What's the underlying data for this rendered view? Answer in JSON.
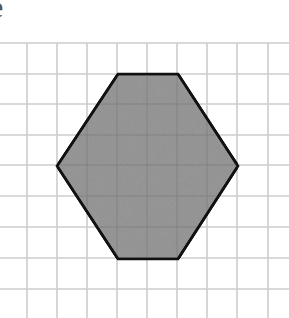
{
  "label": {
    "letter": "e"
  },
  "grid": {
    "line_color": "#cccccc",
    "horizontal_lines_y": [
      43,
      74,
      104,
      135,
      165,
      196,
      227,
      258,
      289
    ],
    "vertical_lines_x": [
      27,
      57,
      87,
      117,
      147,
      177,
      207,
      237,
      268
    ],
    "x_extent": [
      0,
      289
    ],
    "y_extent": [
      43,
      318
    ]
  },
  "shape": {
    "type": "hexagon",
    "fill": "#9b9b9b",
    "stroke": "#111111",
    "vertices": [
      [
        118,
        74
      ],
      [
        178,
        74
      ],
      [
        238,
        166
      ],
      [
        178,
        259
      ],
      [
        118,
        259
      ],
      [
        57,
        166
      ]
    ],
    "grid_units": {
      "top_edge_length": 2,
      "bottom_edge_length": 2,
      "width": 6,
      "height": 6
    }
  }
}
